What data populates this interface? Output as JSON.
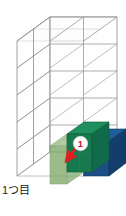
{
  "figure": {
    "title_caption": "1つ目",
    "marker_label": "1",
    "structure": {
      "type": "stacked-cube-grid",
      "columns": 2,
      "rows_depth": 2,
      "levels": 5,
      "description": "Transparent wireframe stack of unit cubes with the bottom-front level filled in color"
    },
    "colors": {
      "wireframe_stroke": "#8c8c8c",
      "wireframe_fill": "#fbfbfb",
      "cube_light_green": "#7fa86a",
      "cube_light_green_top": "#9dbd8b",
      "cube_teal_green_front": "#18794e",
      "cube_teal_green_side": "#0f6b4a",
      "cube_teal_green_top": "#1f8f5d",
      "cube_blue_front": "#1b4f86",
      "cube_blue_side": "#133d6b",
      "cube_blue_top": "#1d5d99",
      "marker_circle_fill": "#ffffff",
      "marker_text": "#cc2020",
      "arrow": "#e02020",
      "caption_text": "#231f20"
    },
    "cubes": [
      {
        "name": "light-green-left",
        "position": "bottom-front-left",
        "color": "#7fa86a",
        "opacity": 0.72
      },
      {
        "name": "teal-green-center",
        "position": "bottom-front-right",
        "color": "#18794e",
        "opacity": 1
      },
      {
        "name": "blue-back-right",
        "position": "bottom-back-right",
        "color": "#1b4f86",
        "opacity": 1
      }
    ],
    "annotations": [
      {
        "name": "step-marker",
        "label": "1",
        "target_cube": "teal-green-center"
      },
      {
        "name": "direction-arrow",
        "direction": "down-left",
        "color": "#e02020"
      }
    ]
  }
}
